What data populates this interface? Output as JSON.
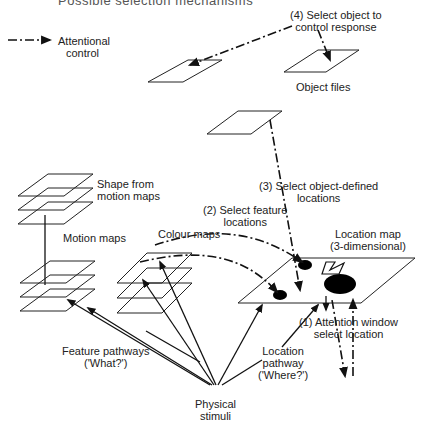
{
  "figure": {
    "title_partial": "Possible selection mechanisms",
    "legend": {
      "symbol": "dash-dot-arrow",
      "label_line1": "Attentional",
      "label_line2": "control"
    },
    "labels": {
      "step4_line1": "(4) Select object to",
      "step4_line2": "control response",
      "object_files": "Object files",
      "step3_line1": "(3) Select object-defined",
      "step3_line2": "locations",
      "shape_from_motion_line1": "Shape from",
      "shape_from_motion_line2": "motion maps",
      "motion_maps": "Motion maps",
      "colour_maps": "Colour maps",
      "step2_line1": "(2) Select feature",
      "step2_line2": "locations",
      "location_map_line1": "Location map",
      "location_map_line2": "(3-dimensional)",
      "step1_line1": "(1) Attention window",
      "step1_line2": "select location",
      "feature_pathways_line1": "Feature pathways",
      "feature_pathways_line2": "('What?')",
      "location_pathway_line1": "Location",
      "location_pathway_line2": "pathway",
      "location_pathway_line3": "('Where?')",
      "physical_stimuli_line1": "Physical",
      "physical_stimuli_line2": "stimuli"
    }
  }
}
